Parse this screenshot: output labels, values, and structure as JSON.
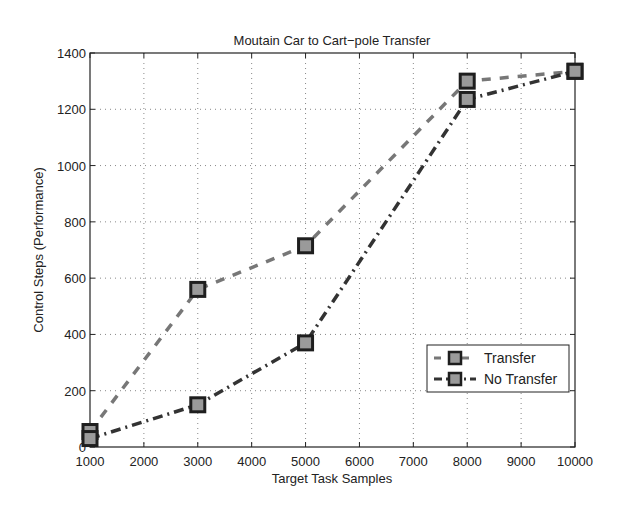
{
  "chart_data": {
    "type": "line",
    "title": "Moutain Car to Cart−pole Transfer",
    "xlabel": "Target Task Samples",
    "ylabel": "Control Steps (Performance)",
    "xlim": [
      1000,
      10000
    ],
    "ylim": [
      0,
      1400
    ],
    "xticks": [
      1000,
      2000,
      3000,
      4000,
      5000,
      6000,
      7000,
      8000,
      9000,
      10000
    ],
    "yticks": [
      0,
      200,
      400,
      600,
      800,
      1000,
      1200,
      1400
    ],
    "grid": true,
    "legend_position": "lower right",
    "x": [
      1000,
      3000,
      5000,
      8000,
      10000
    ],
    "series": [
      {
        "name": "Transfer",
        "values": [
          55,
          560,
          715,
          1300,
          1335
        ],
        "color": "#777777",
        "linestyle": "dashed",
        "marker": "square"
      },
      {
        "name": "No Transfer",
        "values": [
          30,
          150,
          370,
          1235,
          1335
        ],
        "color": "#333333",
        "linestyle": "dashdot",
        "marker": "square"
      }
    ]
  },
  "colors": {
    "marker_face": "#9a9a9a",
    "marker_edge": "#1e1e1e",
    "axis": "#222222",
    "grid": "#888888"
  }
}
